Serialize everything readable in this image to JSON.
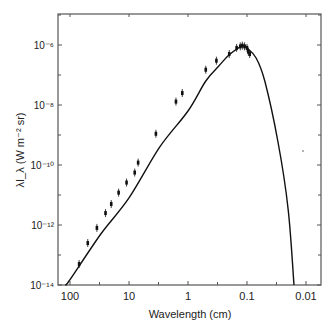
{
  "chart_data": {
    "type": "line",
    "title": "",
    "xlabel": "Wavelength (cm)",
    "ylabel": "λI_λ (W m⁻² sr)",
    "xscale": "log",
    "yscale": "log",
    "x_reversed": true,
    "xlim": [
      150,
      0.007
    ],
    "ylim": [
      1e-14,
      1e-05
    ],
    "grid": false,
    "legend": null,
    "x_tick_labels": [
      "100",
      "10",
      "1",
      "0.1",
      "0.01"
    ],
    "x_ticks": [
      100,
      10,
      1,
      0.1,
      0.01
    ],
    "y_tick_labels": [
      "10⁻⁶",
      "10⁻⁸",
      "10⁻¹⁰",
      "10⁻¹²",
      "10⁻¹⁴"
    ],
    "y_ticks": [
      1e-06,
      1e-08,
      1e-10,
      1e-12,
      1e-14
    ],
    "series": [
      {
        "name": "blackbody fit",
        "style": "line",
        "x": [
          120,
          100,
          30,
          10,
          3,
          1,
          0.5,
          0.3,
          0.2,
          0.12,
          0.1,
          0.07,
          0.05,
          0.03,
          0.02,
          0.016
        ],
        "y": [
          1e-14,
          1.5e-14,
          5e-13,
          8e-12,
          4e-10,
          6.3e-09,
          6.3e-08,
          2e-07,
          4.7e-07,
          9.3e-07,
          7.9e-07,
          3.7e-07,
          6.3e-08,
          6.3e-10,
          3.2e-12,
          1e-14
        ]
      },
      {
        "name": "measurements",
        "style": "points_with_errorbars",
        "x": [
          70,
          50,
          35,
          25,
          20,
          15,
          11,
          8,
          7,
          3.5,
          1.6,
          1.25,
          0.5,
          0.33,
          0.2,
          0.15,
          0.13,
          0.12,
          0.11,
          0.1,
          0.095,
          0.09
        ],
        "y": [
          5e-14,
          2.5e-13,
          8e-13,
          2.5e-12,
          5e-12,
          1.2e-11,
          2.6e-11,
          5.6e-11,
          1.2e-10,
          1.1e-09,
          1.3e-08,
          2.5e-08,
          1.5e-07,
          3e-07,
          5e-07,
          8e-07,
          9e-07,
          9.5e-07,
          9e-07,
          8e-07,
          6e-07,
          5e-07
        ]
      }
    ]
  }
}
